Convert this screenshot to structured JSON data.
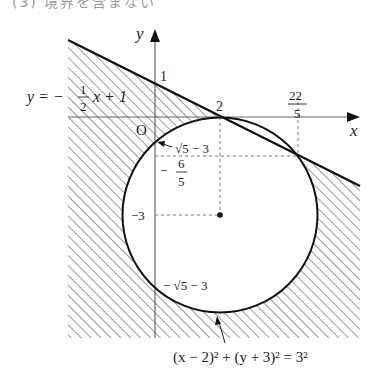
{
  "header": {
    "partial_text": "(3) 境界を含まない"
  },
  "labels": {
    "y_axis": "y",
    "x_axis": "x",
    "origin": "O",
    "y_intercept": "1",
    "x_tangent": "2",
    "x_intersect_num": "22",
    "x_intersect_den": "5",
    "line_eq_prefix": "y = −",
    "line_eq_num": "1",
    "line_eq_den": "2",
    "line_eq_suffix": "x + 1",
    "circle_top_y": "√5 − 3",
    "neg_six_fifths_sign": "−",
    "neg_six_fifths_num": "6",
    "neg_six_fifths_den": "5",
    "center_y": "−3",
    "circle_bottom_y": "− √5 − 3",
    "circle_eq": "(x − 2)² + (y + 3)² = 3²"
  },
  "geometry": {
    "line": "y = -1/2 x + 1",
    "circle": {
      "center": [
        2,
        -3
      ],
      "radius": 3
    },
    "tangent_point": [
      2,
      0
    ],
    "intersection_point": [
      4.4,
      -1.2
    ],
    "region": "shaded outside circle and below line (boundary excluded)"
  },
  "colors": {
    "ink": "#111111",
    "hatch": "#555555",
    "axis": "#666666"
  }
}
